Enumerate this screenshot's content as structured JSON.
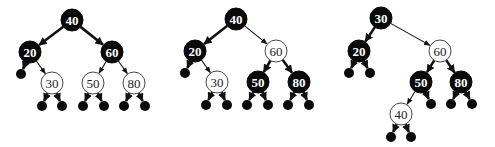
{
  "colors": {
    "black_node": "#0a0a0a",
    "red_node_fill": "#ffffff",
    "red_node_stroke": "#333333",
    "edge": "#111111"
  },
  "trees": [
    {
      "name": "tree-1",
      "nodes": [
        {
          "id": "a40",
          "label": "40",
          "color": "black",
          "x": 72,
          "y": 20
        },
        {
          "id": "a20",
          "label": "20",
          "color": "black",
          "x": 30,
          "y": 52
        },
        {
          "id": "a60",
          "label": "60",
          "color": "black",
          "x": 112,
          "y": 52
        },
        {
          "id": "a30",
          "label": "30",
          "color": "red",
          "x": 52,
          "y": 83
        },
        {
          "id": "a50",
          "label": "50",
          "color": "red",
          "x": 93,
          "y": 83
        },
        {
          "id": "a80",
          "label": "80",
          "color": "red",
          "x": 134,
          "y": 83
        }
      ],
      "nils": [
        {
          "x": 21,
          "y": 74,
          "parent": "a20"
        },
        {
          "x": 42,
          "y": 106,
          "parent": "a30"
        },
        {
          "x": 62,
          "y": 106,
          "parent": "a30"
        },
        {
          "x": 83,
          "y": 106,
          "parent": "a50"
        },
        {
          "x": 104,
          "y": 106,
          "parent": "a50"
        },
        {
          "x": 124,
          "y": 106,
          "parent": "a80"
        },
        {
          "x": 145,
          "y": 106,
          "parent": "a80"
        }
      ],
      "edges": [
        [
          "a40",
          "a20"
        ],
        [
          "a40",
          "a60"
        ],
        [
          "a20",
          "a30"
        ],
        [
          "a60",
          "a50"
        ],
        [
          "a60",
          "a80"
        ]
      ]
    },
    {
      "name": "tree-2",
      "nodes": [
        {
          "id": "b40",
          "label": "40",
          "color": "black",
          "x": 236,
          "y": 19
        },
        {
          "id": "b20",
          "label": "20",
          "color": "black",
          "x": 195,
          "y": 51
        },
        {
          "id": "b60",
          "label": "60",
          "color": "red",
          "x": 276,
          "y": 51
        },
        {
          "id": "b30",
          "label": "30",
          "color": "red",
          "x": 217,
          "y": 82
        },
        {
          "id": "b50",
          "label": "50",
          "color": "black",
          "x": 258,
          "y": 82
        },
        {
          "id": "b80",
          "label": "80",
          "color": "black",
          "x": 299,
          "y": 82
        }
      ],
      "nils": [
        {
          "x": 185,
          "y": 73,
          "parent": "b20"
        },
        {
          "x": 206,
          "y": 105,
          "parent": "b30"
        },
        {
          "x": 227,
          "y": 105,
          "parent": "b30"
        },
        {
          "x": 247,
          "y": 105,
          "parent": "b50"
        },
        {
          "x": 268,
          "y": 105,
          "parent": "b50"
        },
        {
          "x": 288,
          "y": 105,
          "parent": "b80"
        },
        {
          "x": 309,
          "y": 105,
          "parent": "b80"
        }
      ],
      "edges": [
        [
          "b40",
          "b20"
        ],
        [
          "b40",
          "b60"
        ],
        [
          "b20",
          "b30"
        ],
        [
          "b60",
          "b50"
        ],
        [
          "b60",
          "b80"
        ]
      ]
    },
    {
      "name": "tree-3",
      "nodes": [
        {
          "id": "c30",
          "label": "30",
          "color": "black",
          "x": 381,
          "y": 18
        },
        {
          "id": "c20",
          "label": "20",
          "color": "black",
          "x": 359,
          "y": 51
        },
        {
          "id": "c60",
          "label": "60",
          "color": "red",
          "x": 440,
          "y": 51
        },
        {
          "id": "c50",
          "label": "50",
          "color": "black",
          "x": 421,
          "y": 82
        },
        {
          "id": "c80",
          "label": "80",
          "color": "black",
          "x": 461,
          "y": 82
        },
        {
          "id": "c40",
          "label": "40",
          "color": "red",
          "x": 401,
          "y": 114
        }
      ],
      "nils": [
        {
          "x": 349,
          "y": 73,
          "parent": "c20"
        },
        {
          "x": 370,
          "y": 73,
          "parent": "c20"
        },
        {
          "x": 431,
          "y": 104,
          "parent": "c50"
        },
        {
          "x": 451,
          "y": 104,
          "parent": "c80"
        },
        {
          "x": 472,
          "y": 104,
          "parent": "c80"
        },
        {
          "x": 391,
          "y": 137,
          "parent": "c40"
        },
        {
          "x": 411,
          "y": 137,
          "parent": "c40"
        }
      ],
      "edges": [
        [
          "c30",
          "c20"
        ],
        [
          "c30",
          "c60"
        ],
        [
          "c60",
          "c50"
        ],
        [
          "c60",
          "c80"
        ],
        [
          "c50",
          "c40"
        ]
      ]
    }
  ]
}
